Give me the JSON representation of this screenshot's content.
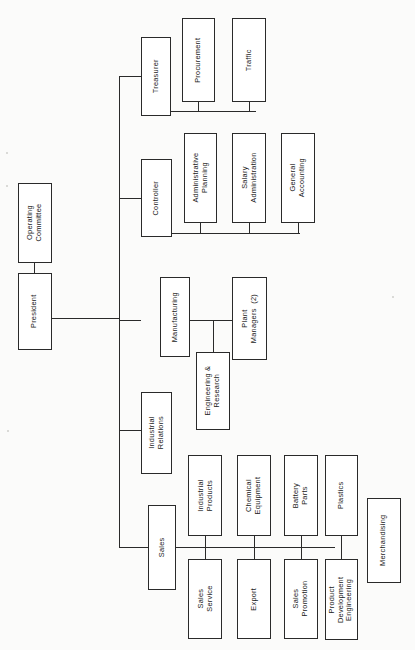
{
  "diagram": {
    "type": "organization-chart",
    "orientation": "rotated-90-ccw",
    "line_color": "#2a2a2a",
    "box_fill": "#ffffff",
    "page_background": "#fbfbfa"
  },
  "nodes": {
    "operating_committee": "Operating\nCommittee",
    "president": "President",
    "treasurer": "Treasurer",
    "procurement": "Procurement",
    "traffic": "Traffic",
    "controller": "Controller",
    "administrative_planning": "Administrative\nPlanning",
    "salary_administration": "Salary\nAdministration",
    "general_accounting": "General\nAccounting",
    "manufacturing": "Manufacturing",
    "engineering_research": "Engineering &\nResearch",
    "plant_managers": "Plant\nManagers  (2)",
    "industrial_relations": "Industrial\nRelations",
    "sales": "Sales",
    "industrial_products": "Industrial\nProducts",
    "sales_service": "Sales\nService",
    "chemical_equipment": "Chemical\nEquipment",
    "export": "Export",
    "battery_parts": "Battery\nParts",
    "sales_promotion": "Sales\nPromotion",
    "plastics": "Plastics",
    "product_development_engineering": "Product\nDevelopment\nEngineering",
    "merchandising": "Merchandising"
  },
  "hierarchy": {
    "root": "president",
    "staff": [
      "operating_committee"
    ],
    "divisions": [
      {
        "name": "treasurer",
        "children": [
          "procurement",
          "traffic"
        ]
      },
      {
        "name": "controller",
        "children": [
          "administrative_planning",
          "salary_administration",
          "general_accounting"
        ]
      },
      {
        "name": "manufacturing",
        "children": [
          "engineering_research",
          "plant_managers"
        ]
      },
      {
        "name": "industrial_relations",
        "children": []
      },
      {
        "name": "sales",
        "children": [
          "industrial_products",
          "sales_service",
          "chemical_equipment",
          "export",
          "battery_parts",
          "sales_promotion",
          "plastics",
          "product_development_engineering",
          "merchandising"
        ]
      }
    ]
  }
}
